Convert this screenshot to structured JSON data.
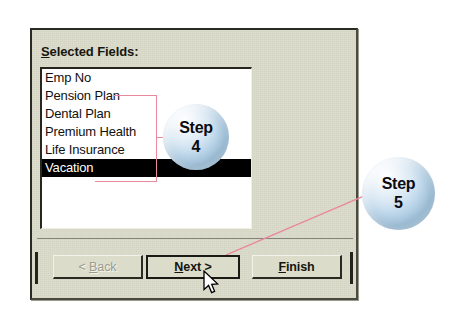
{
  "dialog": {
    "fields_label": {
      "accel": "S",
      "rest": "elected Fields:"
    },
    "listbox": {
      "name": "selected-fields-list",
      "items": [
        {
          "label": "Emp No",
          "selected": false
        },
        {
          "label": "Pension Plan",
          "selected": false
        },
        {
          "label": "Dental Plan",
          "selected": false
        },
        {
          "label": "Premium Health",
          "selected": false
        },
        {
          "label": "Life Insurance",
          "selected": false
        },
        {
          "label": "Vacation",
          "selected": true
        }
      ]
    },
    "buttons": {
      "back": {
        "prefix": "< ",
        "accel": "B",
        "suffix": "ack",
        "enabled": false
      },
      "next": {
        "prefix": "",
        "accel": "N",
        "suffix": "ext >",
        "enabled": true,
        "is_default": true
      },
      "finish": {
        "prefix": "",
        "accel": "F",
        "suffix": "inish",
        "enabled": true
      }
    }
  },
  "annotations": {
    "step4": {
      "word": "Step",
      "number": "4"
    },
    "step5": {
      "word": "Step",
      "number": "5"
    },
    "line_color": "#e8899c"
  },
  "colors": {
    "dialog_face": "#dcdccb",
    "listbox_background": "#ffffff",
    "selection_background": "#000000",
    "selection_text": "#ffffff",
    "annotation_pink": "#e8899c",
    "bubble_blue": "#bcd6ea",
    "page_background": "#ffffff"
  }
}
